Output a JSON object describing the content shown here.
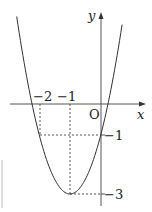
{
  "diagram": {
    "type": "function-graph",
    "function": "y = 2(x+1)^2 - 3",
    "axes": {
      "x_label": "x",
      "y_label": "y",
      "origin_label": "O"
    },
    "tick_labels": {
      "x_neg2": "−2",
      "x_neg1": "−1",
      "y_neg1": "−1",
      "y_neg3": "−3"
    },
    "key_points": [
      {
        "x": -1,
        "y": -3,
        "note": "vertex"
      },
      {
        "x": 0,
        "y": -1
      },
      {
        "x": -2,
        "y": -1
      }
    ],
    "colors": {
      "stroke": "#333333",
      "background": "#ffffff"
    }
  }
}
